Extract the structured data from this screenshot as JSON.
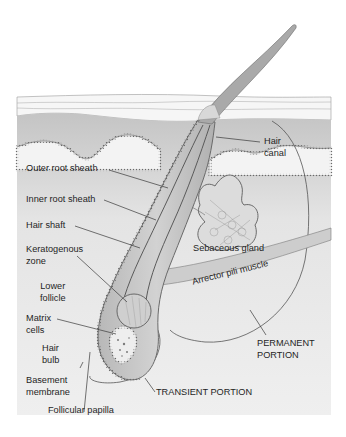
{
  "figure": {
    "type": "anatomical-diagram"
  },
  "colors": {
    "background": "#ffffff",
    "panel": "#f2f2f2",
    "epidermis": "#f4f4f4",
    "dermis_top": "#c8c8c8",
    "follicle_fill": "#bdbdbd",
    "hair_shaft": "#a8a8a8",
    "outline": "#555555",
    "label_text": "#1f1f1f"
  },
  "labels": {
    "hair_canal": "Hair\ncanal",
    "outer_root_sheath": "Outer root sheath",
    "inner_root_sheath": "Inner root sheath",
    "hair_shaft": "Hair shaft",
    "keratogenous_zone": "Keratogenous\nzone",
    "lower_follicle": "Lower\nfollicle",
    "matrix_cells": "Matrix\ncells",
    "hair_bulb": "Hair\nbulb",
    "basement_membrane": "Basement\nmembrane",
    "follicular_papilla": "Follicular papilla",
    "sebaceous_gland": "Sebaceous gland",
    "arrector_pili_muscle": "Arrector pili muscle",
    "permanent_portion": "PERMANENT\nPORTION",
    "transient_portion": "TRANSIENT PORTION"
  }
}
